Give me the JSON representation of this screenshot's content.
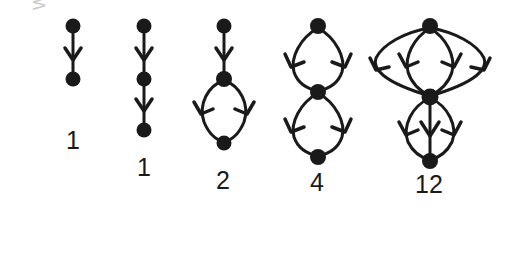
{
  "figure": {
    "background_color": "#ffffff",
    "ink_color": "#1a1a1a",
    "watermark": {
      "text": "WVWWW12",
      "color": "#c9c9c9",
      "rotation_degrees": -90
    },
    "graphs": [
      {
        "id": "graph-1",
        "count_label": "1",
        "node_count": 2,
        "edge_count": 1,
        "description": "two nodes joined by one downward directed edge"
      },
      {
        "id": "graph-2",
        "count_label": "1",
        "node_count": 3,
        "edge_count": 2,
        "description": "vertical chain of three nodes with two downward directed edges"
      },
      {
        "id": "graph-3",
        "count_label": "2",
        "node_count": 3,
        "edge_count": 3,
        "description": "top node to middle node, then middle node splits into two curved edges converging at bottom node"
      },
      {
        "id": "graph-4",
        "count_label": "4",
        "node_count": 3,
        "edge_count": 4,
        "description": "two stacked double edges: top to middle via two curves, middle to bottom via two curves"
      },
      {
        "id": "graph-5",
        "count_label": "12",
        "node_count": 3,
        "edge_count": 7,
        "description": "top node to middle node via four curved edges, middle node to bottom node via three edges"
      }
    ]
  }
}
